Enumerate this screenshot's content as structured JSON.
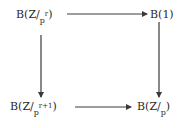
{
  "diagram": {
    "type": "commutative-square",
    "nodes": {
      "top_left": {
        "prefix": "B(Z/",
        "sub": "p",
        "sup": "r",
        "suffix": ")"
      },
      "top_right": {
        "text": "B(1)"
      },
      "bottom_left": {
        "prefix": "B(Z/",
        "sub": "p",
        "sup": "r+1",
        "suffix": ")"
      },
      "bottom_right": {
        "prefix": "B(Z/",
        "sub": "p",
        "suffix": ")"
      }
    },
    "edges": [
      {
        "from": "top_left",
        "to": "top_right",
        "direction": "right"
      },
      {
        "from": "top_left",
        "to": "bottom_left",
        "direction": "down"
      },
      {
        "from": "top_right",
        "to": "bottom_right",
        "direction": "down"
      },
      {
        "from": "bottom_left",
        "to": "bottom_right",
        "direction": "right"
      }
    ],
    "colors": {
      "line": "#3a3a3a",
      "text": "#2a2a2a",
      "background": "#ffffff"
    }
  }
}
